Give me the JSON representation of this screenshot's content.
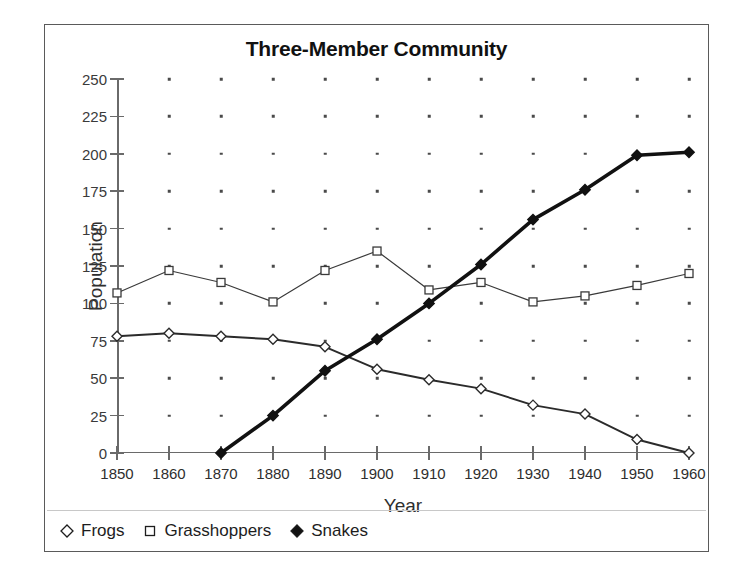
{
  "chart_data": {
    "type": "line",
    "title": "Three-Member Community",
    "xlabel": "Year",
    "ylabel": "Population",
    "x": [
      1850,
      1860,
      1870,
      1880,
      1890,
      1900,
      1910,
      1920,
      1930,
      1940,
      1950,
      1960
    ],
    "xtick_labels": [
      "1850",
      "1860",
      "1870",
      "1880",
      "1890",
      "1900",
      "1910",
      "1920",
      "1930",
      "1940",
      "1950",
      "1960"
    ],
    "ytick_labels": [
      "250",
      "225",
      "200",
      "175",
      "150",
      "125",
      "100",
      "75",
      "50",
      "25",
      "0"
    ],
    "yticks": [
      250,
      225,
      200,
      175,
      150,
      125,
      100,
      75,
      50,
      25,
      0
    ],
    "xlim": [
      1850,
      1960
    ],
    "ylim": [
      0,
      250
    ],
    "grid": "dotted-points",
    "legend_position": "below-axes-left",
    "series": [
      {
        "name": "Frogs",
        "marker": "open-diamond",
        "color": "#2b2b2b",
        "x": [
          1850,
          1860,
          1870,
          1880,
          1890,
          1900,
          1910,
          1920,
          1930,
          1940,
          1950,
          1960
        ],
        "values": [
          78,
          80,
          78,
          76,
          71,
          56,
          49,
          43,
          32,
          26,
          9,
          0
        ]
      },
      {
        "name": "Grasshoppers",
        "marker": "open-square",
        "color": "#3a3a3a",
        "x": [
          1850,
          1860,
          1870,
          1880,
          1890,
          1900,
          1910,
          1920,
          1930,
          1940,
          1950,
          1960
        ],
        "values": [
          107,
          122,
          114,
          101,
          122,
          135,
          109,
          114,
          101,
          105,
          112,
          120
        ]
      },
      {
        "name": "Snakes",
        "marker": "filled-diamond",
        "color": "#111111",
        "x": [
          1870,
          1880,
          1890,
          1900,
          1910,
          1920,
          1930,
          1940,
          1950,
          1960
        ],
        "values": [
          0,
          25,
          55,
          76,
          100,
          126,
          156,
          176,
          199,
          201
        ]
      }
    ]
  },
  "legend": {
    "items": [
      {
        "label": "Frogs",
        "marker": "open-diamond"
      },
      {
        "label": "Grasshoppers",
        "marker": "open-square"
      },
      {
        "label": "Snakes",
        "marker": "filled-diamond"
      }
    ]
  }
}
